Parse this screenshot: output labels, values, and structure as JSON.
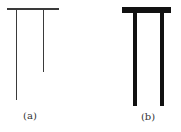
{
  "figure": {
    "panels": [
      {
        "id": "a",
        "label": "(a)",
        "stroke_color": "#3a3a3a",
        "description": "thin T-shaped structure: horizontal bar with two hanging legs of unequal length",
        "top_bar": {
          "x": 7,
          "y": 8,
          "w": 52,
          "h": 1.5
        },
        "legs": [
          {
            "x": 15.5,
            "y": 8,
            "w": 1.5,
            "h": 92
          },
          {
            "x": 42.5,
            "y": 8,
            "w": 1.5,
            "h": 64
          }
        ],
        "label_pos": {
          "x": 30,
          "y": 110
        }
      },
      {
        "id": "b",
        "label": "(b)",
        "stroke_color": "#111111",
        "description": "thick T-shaped structure: heavy horizontal bar with two equal-length hanging legs",
        "top_bar": {
          "x": 122,
          "y": 7,
          "w": 49,
          "h": 6
        },
        "legs": [
          {
            "x": 132.5,
            "y": 7,
            "w": 4.5,
            "h": 99
          },
          {
            "x": 159.5,
            "y": 7,
            "w": 4.5,
            "h": 99
          }
        ],
        "label_pos": {
          "x": 148,
          "y": 111
        }
      }
    ]
  }
}
